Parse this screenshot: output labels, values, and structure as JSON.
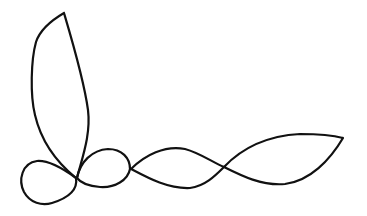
{
  "drawing": {
    "description": "Single continuous black line drawing: tall leaf-shaped loop, small left loop, round middle loop, and two elongated lens shapes extending right",
    "stroke_color": "#111111",
    "background_color": "#ffffff",
    "stroke_width": 2.2
  }
}
